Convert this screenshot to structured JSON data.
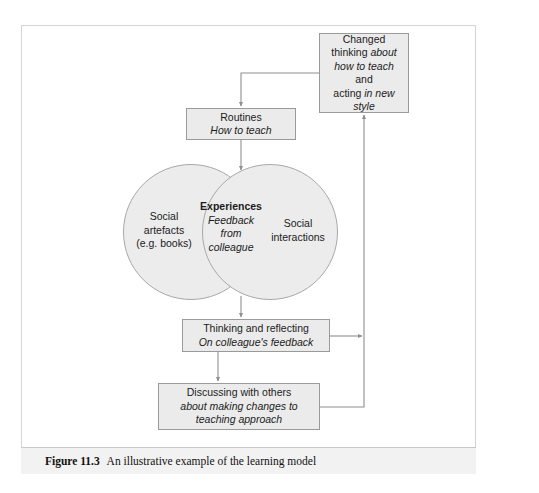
{
  "figure": {
    "caption_number": "Figure 11.3",
    "caption_title": "An illustrative example of the learning model"
  },
  "diagram": {
    "type": "flow-diagram-with-venn",
    "nodes": {
      "changed_thinking": {
        "line1": "Changed",
        "line2_plain_a": "thinking ",
        "line2_italic": "about",
        "line3_italic": "how to teach",
        "line3_plain": " and",
        "line4_plain": "acting ",
        "line4_italic": "in new",
        "line5_italic": "style"
      },
      "routines": {
        "line1": "Routines",
        "line2_italic": "How to teach"
      },
      "thinking_reflecting": {
        "line1": "Thinking and reflecting",
        "line2_italic": "On colleague's feedback"
      },
      "discussing": {
        "line1": "Discussing with others",
        "line2_italic": "about making changes to",
        "line3_italic": "teaching approach"
      },
      "venn_left": {
        "line1": "Social",
        "line2": "artefacts",
        "line3": "(e.g. books)"
      },
      "venn_right": {
        "line1": "Social",
        "line2": "interactions"
      },
      "venn_center": {
        "line1": "Experiences",
        "line2_italic": "Feedback",
        "line3_italic": "from",
        "line4_italic": "colleague"
      }
    },
    "colors": {
      "box_fill": "#ebebeb",
      "box_border": "#9a9a9a",
      "circle_fill": "#ececec",
      "circle_border": "#a8a8a8",
      "connector": "#8f8f8f",
      "frame_border": "#d4d4d4",
      "caption_band": "#f2f2f2",
      "text": "#1b1b1b"
    },
    "connectors": [
      {
        "name": "changed-thinking-to-routines",
        "from": "changed_thinking",
        "to": "routines",
        "arrow": "down"
      },
      {
        "name": "routines-to-venn",
        "from": "routines",
        "to": "venn_center",
        "arrow": "down"
      },
      {
        "name": "venn-to-thinking-reflecting",
        "from": "venn_center",
        "to": "thinking_reflecting",
        "arrow": "down"
      },
      {
        "name": "thinking-reflecting-to-discussing",
        "from": "thinking_reflecting",
        "to": "discussing",
        "arrow": "down"
      },
      {
        "name": "thinking-reflecting-to-changed-thinking",
        "from": "thinking_reflecting",
        "to": "changed_thinking",
        "arrow": "right-then-up"
      },
      {
        "name": "discussing-to-changed-thinking",
        "from": "discussing",
        "to": "changed_thinking",
        "arrow": "right-then-up"
      }
    ]
  }
}
